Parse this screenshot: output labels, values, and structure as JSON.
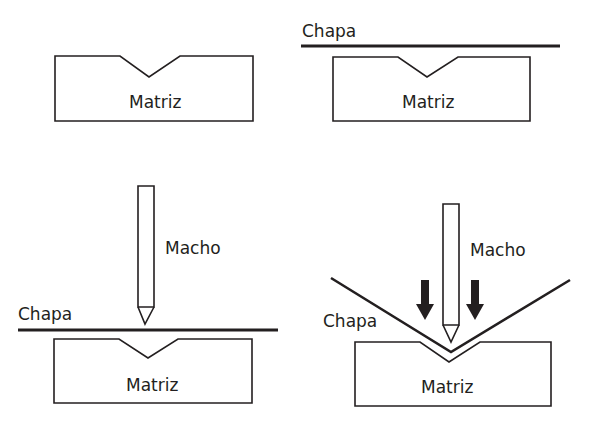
{
  "labels": {
    "die": "Matriz",
    "sheet": "Chapa",
    "punch": "Macho"
  },
  "colors": {
    "ink": "#231f20",
    "background": "#ffffff"
  },
  "panels": [
    {
      "id": 1,
      "position": "top-left",
      "elements": [
        "die"
      ]
    },
    {
      "id": 2,
      "position": "top-right",
      "elements": [
        "sheet",
        "die"
      ]
    },
    {
      "id": 3,
      "position": "bottom-left",
      "elements": [
        "punch",
        "sheet",
        "die"
      ]
    },
    {
      "id": 4,
      "position": "bottom-right",
      "elements": [
        "punch",
        "bent-sheet",
        "die",
        "force-arrows"
      ]
    }
  ]
}
